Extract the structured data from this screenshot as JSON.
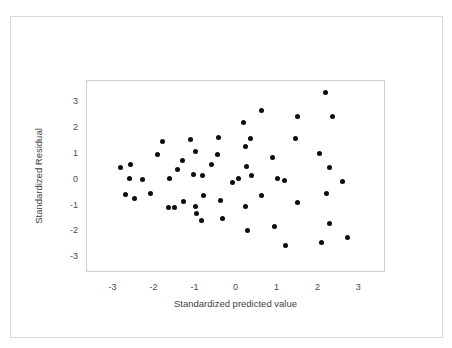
{
  "chart_data": {
    "type": "scatter",
    "title": "",
    "xlabel": "Standardized predicted value",
    "ylabel": "Standardized Residual",
    "xlim": [
      -3.65,
      3.65
    ],
    "ylim": [
      -3.6,
      3.8
    ],
    "xticks": [
      -3,
      -2,
      -1,
      0,
      1,
      2,
      3
    ],
    "xtick_labels": [
      "-3",
      "-2",
      "-1",
      "0",
      "1",
      "2",
      "3"
    ],
    "yticks": [
      3,
      2,
      1,
      0,
      -1,
      -2,
      -3
    ],
    "ytick_labels": [
      "3",
      "2",
      "1",
      "0",
      "-1",
      "-2",
      "-3"
    ],
    "grid": false,
    "legend": null,
    "marker": "circle",
    "marker_color": "#0d0d0d",
    "marker_size_px": 5,
    "n_points": 56,
    "points": [
      {
        "x": -2.82,
        "y": 0.48
      },
      {
        "x": -2.58,
        "y": 0.6
      },
      {
        "x": -2.62,
        "y": 0.05
      },
      {
        "x": -2.7,
        "y": -0.58
      },
      {
        "x": -2.48,
        "y": -0.72
      },
      {
        "x": -2.1,
        "y": -0.55
      },
      {
        "x": -1.94,
        "y": 0.95
      },
      {
        "x": -1.8,
        "y": 1.48
      },
      {
        "x": -1.64,
        "y": 0.05
      },
      {
        "x": -1.66,
        "y": -1.08
      },
      {
        "x": -1.44,
        "y": 0.4
      },
      {
        "x": -1.32,
        "y": 0.75
      },
      {
        "x": -1.3,
        "y": -0.85
      },
      {
        "x": -1.12,
        "y": 1.55
      },
      {
        "x": -1.0,
        "y": 1.1
      },
      {
        "x": -1.06,
        "y": 0.18
      },
      {
        "x": -1.0,
        "y": -1.02
      },
      {
        "x": -0.98,
        "y": -1.32
      },
      {
        "x": -0.86,
        "y": -1.58
      },
      {
        "x": -0.82,
        "y": 0.17
      },
      {
        "x": -0.8,
        "y": -0.6
      },
      {
        "x": -0.44,
        "y": 1.62
      },
      {
        "x": -0.46,
        "y": 0.96
      },
      {
        "x": -0.38,
        "y": -0.8
      },
      {
        "x": -0.34,
        "y": -1.5
      },
      {
        "x": -0.1,
        "y": -0.12
      },
      {
        "x": 0.18,
        "y": 2.2
      },
      {
        "x": 0.22,
        "y": 1.26
      },
      {
        "x": 0.24,
        "y": 0.5
      },
      {
        "x": 0.22,
        "y": -1.02
      },
      {
        "x": 0.28,
        "y": -1.98
      },
      {
        "x": 0.34,
        "y": 1.58
      },
      {
        "x": 0.36,
        "y": 0.16
      },
      {
        "x": 0.62,
        "y": 2.68
      },
      {
        "x": 0.6,
        "y": -0.62
      },
      {
        "x": 0.88,
        "y": 0.84
      },
      {
        "x": 0.92,
        "y": -1.8
      },
      {
        "x": 1.18,
        "y": -0.05
      },
      {
        "x": 1.2,
        "y": -2.55
      },
      {
        "x": 1.44,
        "y": 1.58
      },
      {
        "x": 1.48,
        "y": 2.42
      },
      {
        "x": 1.5,
        "y": -0.9
      },
      {
        "x": 2.02,
        "y": 1.02
      },
      {
        "x": 2.08,
        "y": -2.44
      },
      {
        "x": 2.18,
        "y": 3.34
      },
      {
        "x": 2.2,
        "y": -0.55
      },
      {
        "x": 2.26,
        "y": 0.48
      },
      {
        "x": 2.28,
        "y": -1.68
      },
      {
        "x": 2.34,
        "y": 2.42
      },
      {
        "x": 2.6,
        "y": -0.08
      },
      {
        "x": 2.7,
        "y": -2.22
      },
      {
        "x": -1.52,
        "y": -1.06
      },
      {
        "x": 0.05,
        "y": 0.05
      },
      {
        "x": -0.62,
        "y": 0.6
      },
      {
        "x": 1.0,
        "y": 0.05
      },
      {
        "x": -2.3,
        "y": 0.02
      }
    ]
  }
}
